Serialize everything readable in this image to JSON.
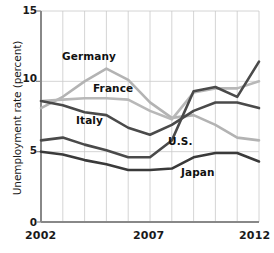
{
  "chart_data": {
    "type": "line",
    "title": "",
    "xlabel": "",
    "ylabel": "Unemployment rate (percent)",
    "xlim": [
      2002,
      2012
    ],
    "ylim": [
      0,
      15
    ],
    "yticks": [
      0,
      5,
      10,
      15
    ],
    "ytick_labels": [
      "0",
      "5",
      "10",
      "15"
    ],
    "xticks": [
      2002,
      2007,
      2012
    ],
    "xtick_labels": [
      "2002",
      "2007",
      "2012"
    ],
    "grid": "vertical-and-horizontal",
    "legend_position": "inline-annotations",
    "x": [
      2002,
      2003,
      2004,
      2005,
      2006,
      2007,
      2008,
      2009,
      2010,
      2011,
      2012
    ],
    "series": [
      {
        "name": "Germany",
        "color": "#b3b3b3",
        "values": [
          8.1,
          8.9,
          10.0,
          10.9,
          10.1,
          8.5,
          7.4,
          7.6,
          6.9,
          6.0,
          5.8
        ]
      },
      {
        "name": "France",
        "color": "#b8b8b8",
        "values": [
          8.6,
          8.7,
          8.8,
          8.8,
          8.7,
          7.9,
          7.3,
          9.2,
          9.5,
          9.5,
          10.0
        ]
      },
      {
        "name": "Italy",
        "color": "#4a4a4a",
        "values": [
          8.6,
          8.3,
          7.8,
          7.6,
          6.7,
          6.2,
          6.9,
          7.9,
          8.5,
          8.5,
          8.1
        ]
      },
      {
        "name": "U.S.",
        "color": "#4a4a4a",
        "values": [
          5.8,
          6.0,
          5.5,
          5.1,
          4.6,
          4.6,
          5.8,
          9.3,
          9.6,
          8.9,
          11.4
        ]
      },
      {
        "name": "Japan",
        "color": "#3a3a3a",
        "values": [
          5.0,
          4.8,
          4.4,
          4.1,
          3.7,
          3.7,
          3.8,
          4.6,
          4.9,
          4.9,
          4.3
        ]
      }
    ],
    "annotations": [
      {
        "text": "Germany",
        "x_px": 62,
        "y_px": 56
      },
      {
        "text": "France",
        "x_px": 92,
        "y_px": 88
      },
      {
        "text": "Italy",
        "x_px": 76,
        "y_px": 120
      },
      {
        "text": "U.S.",
        "x_px": 169,
        "y_px": 141
      },
      {
        "text": "Japan",
        "x_px": 182,
        "y_px": 172
      }
    ]
  }
}
